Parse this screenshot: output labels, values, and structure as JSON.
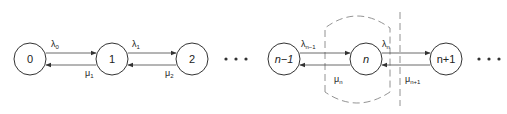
{
  "diagram": {
    "type": "birth-death-state-transition",
    "nodes": [
      {
        "id": "0",
        "label": "0",
        "cx": 30,
        "cy": 59
      },
      {
        "id": "1",
        "label": "1",
        "cx": 112,
        "cy": 59
      },
      {
        "id": "2",
        "label": "2",
        "cx": 192,
        "cy": 59
      },
      {
        "id": "n-1",
        "label": "n−1",
        "cx": 284,
        "cy": 59
      },
      {
        "id": "n",
        "label": "n",
        "cx": 366,
        "cy": 59
      },
      {
        "id": "n+1",
        "label": "n+1",
        "cx": 446,
        "cy": 59
      }
    ],
    "transitions": [
      {
        "from": "0",
        "to": "1",
        "forward_rate": "λ",
        "forward_sub": "0",
        "backward_rate": "μ",
        "backward_sub": "1"
      },
      {
        "from": "1",
        "to": "2",
        "forward_rate": "λ",
        "forward_sub": "1",
        "backward_rate": "μ",
        "backward_sub": "2"
      },
      {
        "from": "n-1",
        "to": "n",
        "forward_rate": "λ",
        "forward_sub": "n−1",
        "backward_rate": "μ",
        "backward_sub": "n"
      },
      {
        "from": "n",
        "to": "n+1",
        "forward_rate": "λ",
        "forward_sub": "n",
        "backward_rate": "μ",
        "backward_sub": "n+1"
      }
    ],
    "ellipses": [
      "• • •",
      "• • •"
    ],
    "boundaries": [
      {
        "type": "dashed-enclosure",
        "around": "n"
      },
      {
        "type": "dashed-vertical-cut",
        "between": [
          "n",
          "n+1"
        ]
      }
    ]
  }
}
